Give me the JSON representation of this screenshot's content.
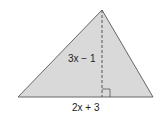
{
  "diagram": {
    "shape": "triangle",
    "fill_color": "#d9d9d9",
    "stroke_color": "#555555",
    "height_label": "3x − 1",
    "base_label": "2x + 3",
    "right_angle_marker": true,
    "altitude_style": "dashed"
  }
}
